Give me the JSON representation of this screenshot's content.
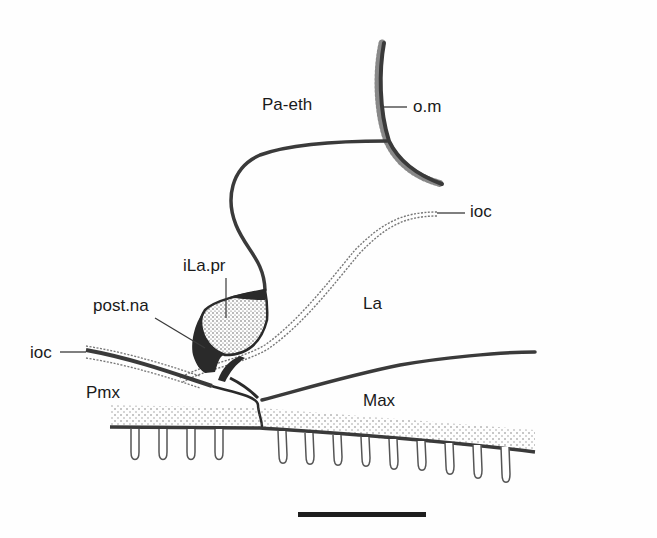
{
  "figure": {
    "type": "anatomical diagram (skull, lateral view of snout)",
    "labels": {
      "pa_eth": "Pa-eth",
      "om": "o.m",
      "ioc_right": "ioc",
      "ila_pr": "iLa.pr",
      "la": "La",
      "post_na": "post.na",
      "ioc_left": "ioc",
      "pmx": "Pmx",
      "max": "Max"
    },
    "scale_bar": {
      "present": true
    },
    "colors": {
      "line": "#3a3a3a",
      "dark_fill": "#2a2a2a",
      "stipple": "#555555",
      "background": "#fefefe",
      "text": "#1a1a1a"
    },
    "teeth": {
      "premaxilla_count": 4,
      "maxilla_count": 9
    }
  }
}
